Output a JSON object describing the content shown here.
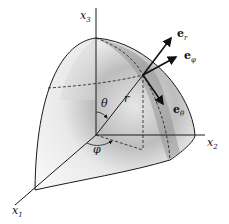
{
  "figure": {
    "axes": {
      "x1": {
        "base": "x",
        "sub": "1"
      },
      "x2": {
        "base": "x",
        "sub": "2"
      },
      "x3": {
        "base": "x",
        "sub": "3"
      }
    },
    "angles": {
      "theta": "θ",
      "phi": "φ"
    },
    "radius_label": "r",
    "unit_vectors": {
      "e_r": {
        "base": "e",
        "sub": "r"
      },
      "e_phi": {
        "base": "e",
        "sub": "φ"
      },
      "e_theta": {
        "base": "e",
        "sub": "θ"
      }
    },
    "colors": {
      "line": "#1a1a1a",
      "shade_dark": "#6a6a6a",
      "shade_light": "#f4f4f4"
    }
  }
}
